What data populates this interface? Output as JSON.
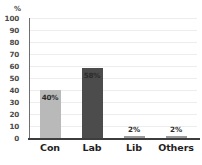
{
  "chart_data": {
    "type": "bar",
    "title": "",
    "subtitle": "",
    "xlabel": "",
    "ylabel": "",
    "yunit": "%",
    "categories": [
      "Con",
      "Lab",
      "Lib",
      "Others"
    ],
    "values": [
      40,
      58,
      2,
      2
    ],
    "data_labels": [
      "40%",
      "58%",
      "2%",
      "2%"
    ],
    "bar_colors": [
      "#b9b9b9",
      "#4c4c4c",
      "#9a9a9a",
      "#9a9a9a"
    ],
    "ylim": [
      0,
      100
    ],
    "yticks": [
      100,
      90,
      80,
      70,
      60,
      50,
      40,
      30,
      20,
      10,
      0
    ],
    "ytick_labels": [
      "100",
      "90",
      "80",
      "70",
      "60",
      "50",
      "40",
      "30",
      "20",
      "10",
      "0"
    ],
    "grid": true,
    "legend": false,
    "legend_position": "none",
    "background_color": "#ffffff",
    "axis_color": "#3d3d3d",
    "grid_color": "#ededed",
    "label_color": "#1f1f1f"
  }
}
